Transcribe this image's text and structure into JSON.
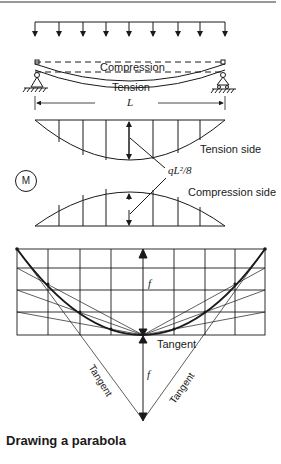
{
  "figure": {
    "caption": "Drawing a parabola",
    "beam": {
      "compression_label": "Compression",
      "tension_label": "Tension",
      "span_label": "L"
    },
    "moment_diagram": {
      "symbol": "M",
      "tension_side_label": "Tension side",
      "compression_side_label": "Compression side",
      "max_moment_label": "qL²/8"
    },
    "parabola_construction": {
      "height_label_top": "f",
      "height_label_bottom": "f",
      "tangent_label_center": "Tangent",
      "tangent_label_left": "Tangent",
      "tangent_label_right": "Tangent"
    }
  }
}
